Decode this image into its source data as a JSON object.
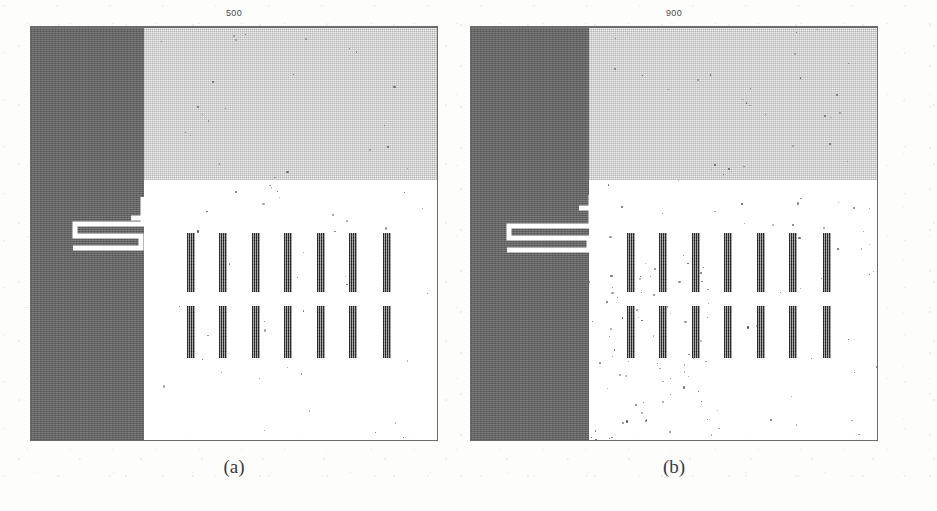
{
  "figure": {
    "background_color": "#fdfdfb",
    "panels": [
      {
        "id": "a",
        "title": "500",
        "caption": "(a)",
        "dark_column_color": "#6e6e6e",
        "noise_band_color": "#f2f2f2",
        "bar_color": "#5d5d5d",
        "bar_count_per_row": 7,
        "bar_rows": 2,
        "noise_density": "low"
      },
      {
        "id": "b",
        "title": "900",
        "caption": "(b)",
        "dark_column_color": "#6e6e6e",
        "noise_band_color": "#f2f2f2",
        "bar_color": "#5d5d5d",
        "bar_count_per_row": 7,
        "bar_rows": 2,
        "noise_density": "high"
      }
    ]
  },
  "chart_data": {
    "type": "heatmap",
    "title": "",
    "xlabel": "",
    "ylabel": "",
    "panels": [
      {
        "label": "(a)",
        "title": "500",
        "regions": [
          {
            "name": "dark-occupancy-column",
            "x_frac": [
              0.0,
              0.277
            ],
            "y_frac": [
              0.0,
              1.0
            ],
            "value": "occupied"
          },
          {
            "name": "textured-unknown-band",
            "x_frac": [
              0.277,
              1.0
            ],
            "y_frac": [
              0.0,
              0.366
            ],
            "value": "unknown"
          },
          {
            "name": "free-space",
            "x_frac": [
              0.277,
              1.0
            ],
            "y_frac": [
              0.366,
              1.0
            ],
            "value": "free"
          }
        ],
        "bars_row1_x_frac": [
          0.385,
          0.465,
          0.545,
          0.625,
          0.705,
          0.785,
          0.868
        ],
        "bars_row2_x_frac": [
          0.385,
          0.465,
          0.545,
          0.625,
          0.705,
          0.785,
          0.868
        ],
        "bars_row1_y_frac": [
          0.497,
          0.64
        ],
        "bars_row2_y_frac": [
          0.675,
          0.8
        ],
        "scattered_noise_points": 62
      },
      {
        "label": "(b)",
        "title": "900",
        "regions": [
          {
            "name": "dark-occupancy-column",
            "x_frac": [
              0.0,
              0.289
            ],
            "y_frac": [
              0.0,
              1.0
            ],
            "value": "occupied"
          },
          {
            "name": "textured-unknown-band",
            "x_frac": [
              0.289,
              1.0
            ],
            "y_frac": [
              0.0,
              0.366
            ],
            "value": "unknown"
          },
          {
            "name": "free-space",
            "x_frac": [
              0.289,
              1.0
            ],
            "y_frac": [
              0.366,
              1.0
            ],
            "value": "free"
          }
        ],
        "bars_row1_x_frac": [
          0.385,
          0.465,
          0.545,
          0.625,
          0.705,
          0.785,
          0.868
        ],
        "bars_row2_x_frac": [
          0.385,
          0.465,
          0.545,
          0.625,
          0.705,
          0.785,
          0.868
        ],
        "bars_row1_y_frac": [
          0.497,
          0.64
        ],
        "bars_row2_y_frac": [
          0.675,
          0.8
        ],
        "scattered_noise_points": 148
      }
    ],
    "legend": [],
    "grid": false
  }
}
